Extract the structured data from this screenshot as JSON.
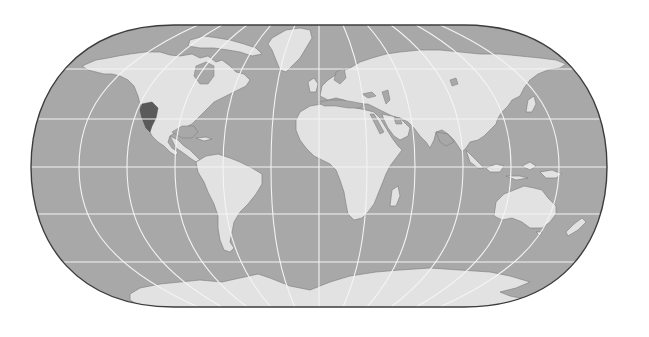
{
  "map": {
    "title": "World map (Eckert IV-style pseudocylindrical projection)",
    "projection": "Eckert IV",
    "graticule_interval_deg": 30,
    "colors": {
      "background": "#ffffff",
      "ocean": "#a8a8a8",
      "land": "#e2e2e2",
      "highlight_region": "#5a5a5a",
      "graticule": "#f4f4f4",
      "outline": "#3c3c3c",
      "coast": "#7a7a7a"
    },
    "frame": {
      "center_x": 319,
      "equator_y": 167,
      "half_width_px": 288,
      "top_y": 25,
      "bottom_y": 307,
      "pole_line_half_width_px": 145
    },
    "latitude_lines_y": [
      69,
      119,
      167,
      214,
      262
    ],
    "meridian_longitudes": [
      -150,
      -120,
      -90,
      -60,
      -30,
      0,
      30,
      60,
      90,
      120,
      150
    ],
    "regions": [
      {
        "name": "North America"
      },
      {
        "name": "Greenland"
      },
      {
        "name": "South America"
      },
      {
        "name": "Europe"
      },
      {
        "name": "Asia"
      },
      {
        "name": "Africa"
      },
      {
        "name": "Madagascar"
      },
      {
        "name": "Arabian Peninsula"
      },
      {
        "name": "Indian Subcontinent"
      },
      {
        "name": "Southeast Asia"
      },
      {
        "name": "Japan"
      },
      {
        "name": "Australia"
      },
      {
        "name": "New Zealand"
      },
      {
        "name": "Antarctica"
      },
      {
        "name": "British Isles"
      },
      {
        "name": "Highlighted region (Western North America)"
      }
    ]
  }
}
